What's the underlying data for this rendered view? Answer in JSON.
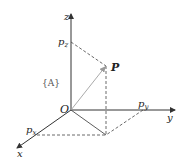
{
  "diagram": {
    "type": "3d-coordinate-frame",
    "frame_label": "{A}",
    "origin_label": "O",
    "axes": {
      "x": "x",
      "y": "y",
      "z": "z"
    },
    "point_label": "P",
    "projections": {
      "px": "p",
      "px_sub": "x",
      "py": "p",
      "py_sub": "y",
      "pz": "p",
      "pz_sub": "z"
    },
    "colors": {
      "axis": "#333333",
      "vector": "#aaaaaa",
      "dashed": "#444444"
    }
  }
}
